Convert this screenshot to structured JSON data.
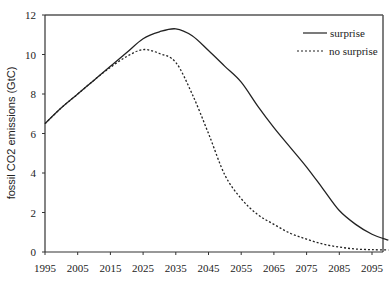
{
  "chart_data": {
    "type": "line",
    "title": "",
    "xlabel": "",
    "ylabel": "fossil CO2 emissions (GtC)",
    "xlim": [
      1995,
      2100
    ],
    "ylim": [
      0,
      12
    ],
    "x_ticks": [
      1995,
      2005,
      2015,
      2025,
      2035,
      2045,
      2055,
      2065,
      2075,
      2085,
      2095
    ],
    "y_ticks": [
      0,
      2,
      4,
      6,
      8,
      10,
      12
    ],
    "grid": false,
    "legend_position": "upper right",
    "x": [
      1995,
      2000,
      2005,
      2010,
      2015,
      2020,
      2025,
      2030,
      2035,
      2040,
      2045,
      2050,
      2055,
      2060,
      2065,
      2070,
      2075,
      2080,
      2085,
      2090,
      2095,
      2100
    ],
    "series": [
      {
        "name": "surprise",
        "style": "solid",
        "values": [
          6.5,
          7.3,
          8.0,
          8.7,
          9.4,
          10.1,
          10.8,
          11.15,
          11.3,
          10.95,
          10.2,
          9.4,
          8.6,
          7.4,
          6.3,
          5.3,
          4.3,
          3.2,
          2.1,
          1.4,
          0.9,
          0.6
        ]
      },
      {
        "name": "no surprise",
        "style": "dotted",
        "values": [
          6.5,
          7.3,
          8.0,
          8.7,
          9.35,
          9.9,
          10.25,
          10.05,
          9.6,
          8.0,
          6.0,
          3.9,
          2.7,
          1.9,
          1.4,
          0.95,
          0.65,
          0.4,
          0.25,
          0.15,
          0.12,
          0.1
        ]
      }
    ]
  },
  "legend": {
    "items": [
      {
        "label": "surprise"
      },
      {
        "label": "no surprise"
      }
    ]
  },
  "colors": {
    "line": "#222222",
    "axis": "#333333",
    "frame": "#555555"
  }
}
